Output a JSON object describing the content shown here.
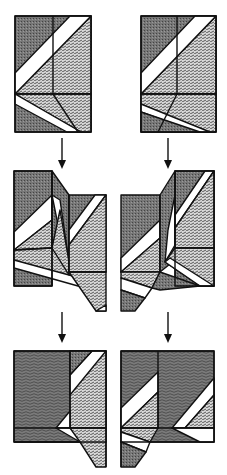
{
  "diagram": {
    "type": "origami-folding-steps",
    "layout": "two columns x three rows of fold steps",
    "colors": {
      "background": "#ffffff",
      "line": "#111111",
      "dark_fill": "#6e6e6e",
      "medium_fill": "#8a8a8a",
      "pattern_fill": "#b8b8b8",
      "white_strip": "#ffffff"
    },
    "steps": [
      {
        "id": "step-1-left",
        "row": 1,
        "column": "left",
        "description": "Square base with diagonal white strips and dashed-pattern triangle"
      },
      {
        "id": "step-1-right",
        "row": 1,
        "column": "right",
        "description": "Mirror variant with crossing strip at lower-left"
      },
      {
        "id": "step-2-left",
        "row": 2,
        "column": "left",
        "description": "Partially folded, right flap shifted down"
      },
      {
        "id": "step-2-right",
        "row": 2,
        "column": "right",
        "description": "Partially folded, left flap shifted down"
      },
      {
        "id": "step-3-left",
        "row": 3,
        "column": "left",
        "description": "Folded result with tab extending down at right"
      },
      {
        "id": "step-3-right",
        "row": 3,
        "column": "right",
        "description": "Folded result with tab extending down at left"
      }
    ],
    "arrows": [
      {
        "from": "step-1-left",
        "to": "step-2-left",
        "direction": "down"
      },
      {
        "from": "step-1-right",
        "to": "step-2-right",
        "direction": "down"
      },
      {
        "from": "step-2-left",
        "to": "step-3-left",
        "direction": "down"
      },
      {
        "from": "step-2-right",
        "to": "step-3-right",
        "direction": "down"
      }
    ]
  }
}
